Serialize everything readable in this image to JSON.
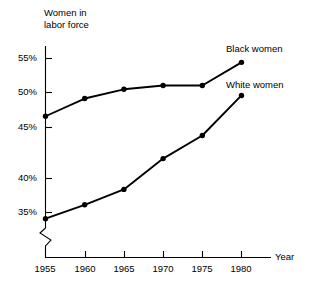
{
  "chart_data": {
    "type": "line",
    "title": "",
    "ylabel": "Women in\nlabor force",
    "xlabel": "Year",
    "x": [
      1955,
      1960,
      1965,
      1970,
      1975,
      1980
    ],
    "x_tick_labels": [
      "1955",
      "1960",
      "1965",
      "1970",
      "1975",
      "1980"
    ],
    "y_tick_labels": [
      "55%",
      "50%",
      "45%",
      "40%",
      "35%"
    ],
    "y_ticks": [
      55,
      50,
      45,
      40,
      35
    ],
    "ylim": [
      33,
      56.5
    ],
    "xlim": [
      1955,
      1980
    ],
    "y_axis_break": true,
    "grid": false,
    "legend_position": "inline-right",
    "series": [
      {
        "name": "Black women",
        "values": [
          47.5,
          49.8,
          51.0,
          51.5,
          51.5,
          54.5
        ],
        "marker": "filled-circle",
        "color": "#000000"
      },
      {
        "name": "White women",
        "values": [
          34.2,
          36.0,
          38.0,
          42.0,
          45.0,
          50.2
        ],
        "marker": "filled-circle",
        "color": "#000000"
      }
    ]
  },
  "labels": {
    "y_axis_title_line1": "Women in",
    "y_axis_title_line2": "labor force",
    "x_axis_title": "Year",
    "series_black": "Black women",
    "series_white": "White women",
    "y_tick_55": "55%",
    "y_tick_50": "50%",
    "y_tick_45": "45%",
    "y_tick_40": "40%",
    "y_tick_35": "35%",
    "x_tick_1955": "1955",
    "x_tick_1960": "1960",
    "x_tick_1965": "1965",
    "x_tick_1970": "1970",
    "x_tick_1975": "1975",
    "x_tick_1980": "1980"
  },
  "colors": {
    "line": "#000000",
    "axis": "#000000",
    "background": "#ffffff"
  }
}
